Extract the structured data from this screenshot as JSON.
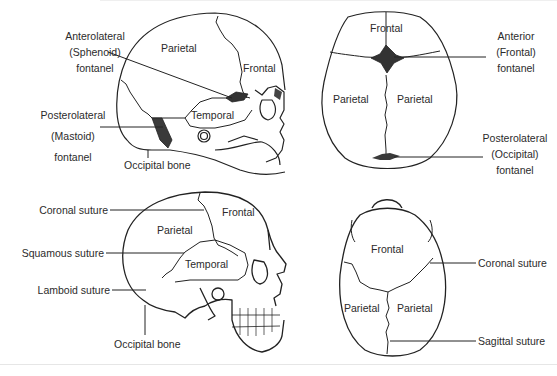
{
  "figure": {
    "panels": [
      {
        "id": "infant-lateral",
        "view": "Infant skull, lateral view",
        "bones": [
          "Parietal",
          "Frontal",
          "Temporal"
        ],
        "callouts": [
          {
            "lines": [
              "Anterolateral",
              "(Sphenoid)",
              "fontanel"
            ]
          },
          {
            "lines": [
              "Posterolateral",
              "(Mastoid)",
              "fontanel"
            ]
          },
          {
            "lines": [
              "Occipital bone"
            ]
          }
        ]
      },
      {
        "id": "infant-superior",
        "view": "Infant skull, superior view",
        "bones": [
          "Frontal",
          "Parietal",
          "Parietal"
        ],
        "callouts": [
          {
            "lines": [
              "Anterior",
              "(Frontal)",
              "fontanel"
            ]
          },
          {
            "lines": [
              "Posterolateral",
              "(Occipital)",
              "fontanel"
            ]
          }
        ]
      },
      {
        "id": "adult-lateral",
        "view": "Adult skull, lateral view",
        "bones": [
          "Frontal",
          "Parietal",
          "Temporal"
        ],
        "callouts": [
          {
            "lines": [
              "Coronal suture"
            ]
          },
          {
            "lines": [
              "Squamous suture"
            ]
          },
          {
            "lines": [
              "Lamboid suture"
            ]
          },
          {
            "lines": [
              "Occipital bone"
            ]
          }
        ]
      },
      {
        "id": "adult-superior",
        "view": "Adult skull, superior view",
        "bones": [
          "Frontal",
          "Parietal",
          "Parietal"
        ],
        "callouts": [
          {
            "lines": [
              "Coronal suture"
            ]
          },
          {
            "lines": [
              "Sagittal suture"
            ]
          }
        ]
      }
    ],
    "colors": {
      "ink": "#222222",
      "label": "#2b2b2b",
      "fontanel": "#3a3a3a",
      "background": "#ffffff"
    }
  }
}
